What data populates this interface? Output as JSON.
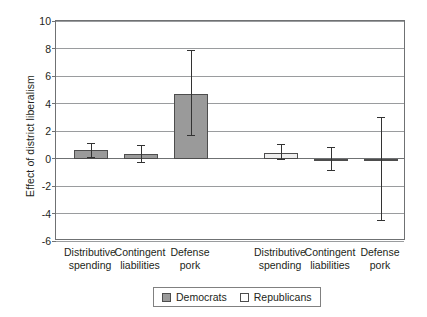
{
  "chart_data": {
    "type": "bar",
    "title": "",
    "xlabel": "",
    "ylabel": "Effect of district liberalism",
    "ylim": [
      -6,
      10
    ],
    "ytick_step": 2,
    "yticks": [
      "10",
      "8",
      "6",
      "4",
      "2",
      "0",
      "-2",
      "-4",
      "-6"
    ],
    "grid": "horizontal",
    "legend_position": "bottom-center",
    "categories": [
      "Distributive spending",
      "Contingent liabilities",
      "Defense pork"
    ],
    "category_lines": [
      {
        "l1": "Distributive",
        "l2": "spending"
      },
      {
        "l1": "Contingent",
        "l2": "liabilities"
      },
      {
        "l1": "Defense",
        "l2": "pork"
      }
    ],
    "series": [
      {
        "name": "Democrats",
        "fill": "#9a9a9a",
        "values": [
          0.6,
          0.35,
          4.7
        ],
        "err_low": [
          0.1,
          -0.25,
          1.7
        ],
        "err_high": [
          1.15,
          1.0,
          7.9
        ]
      },
      {
        "name": "Republicans",
        "fill": "#eeeeee",
        "values": [
          0.4,
          -0.05,
          -0.1
        ],
        "err_low": [
          -0.05,
          -0.85,
          -4.5
        ],
        "err_high": [
          1.05,
          0.85,
          3.05
        ]
      }
    ]
  },
  "legend": {
    "entries": [
      {
        "label": "Democrats",
        "swatch": "dem"
      },
      {
        "label": "Republicans",
        "swatch": "rep"
      }
    ]
  },
  "axis": {
    "y_title": "Effect of district liberalism"
  }
}
